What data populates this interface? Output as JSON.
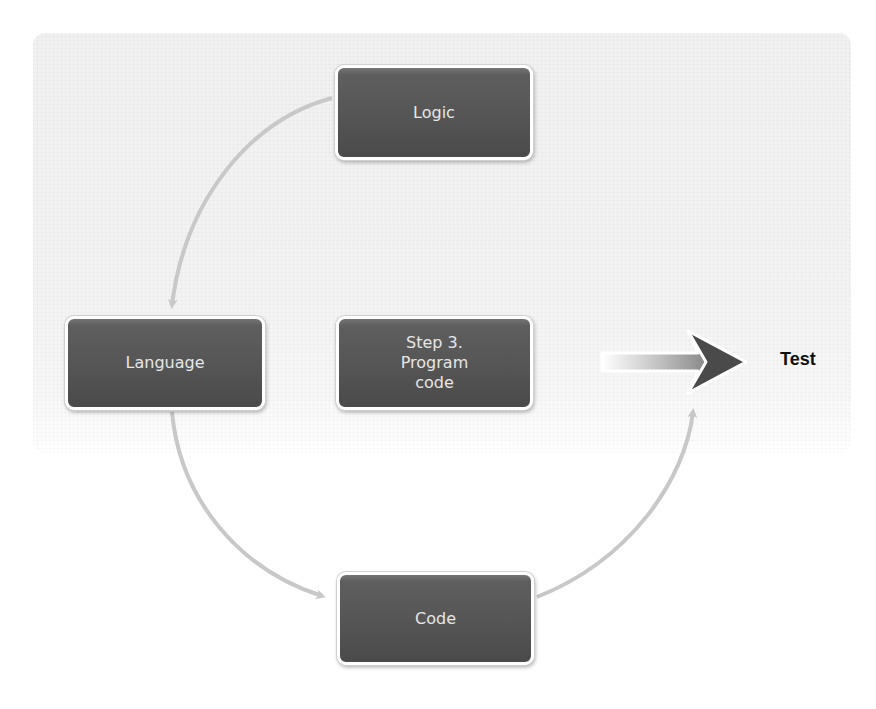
{
  "diagram": {
    "type": "cycle",
    "nodes": [
      {
        "id": "logic",
        "label": "Logic"
      },
      {
        "id": "language",
        "label": "Language"
      },
      {
        "id": "code",
        "label": "Code"
      },
      {
        "id": "center",
        "label": "Step 3.\nProgram\ncode"
      }
    ],
    "edges": [
      {
        "from": "logic",
        "to": "language"
      },
      {
        "from": "language",
        "to": "code"
      },
      {
        "from": "code",
        "to": "logic"
      }
    ],
    "output": {
      "arrow": "right-arrow",
      "label": "Test"
    },
    "colors": {
      "box_fill": "#565656",
      "box_border": "#ffffff",
      "box_text": "#e6e6e6",
      "connector": "#c8c8c8",
      "arrow_dark": "#4a4a4a",
      "panel": "#f2f2f2",
      "output_text": "#111111"
    }
  }
}
